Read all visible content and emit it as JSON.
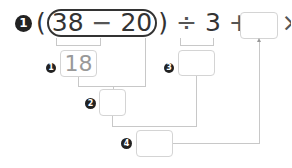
{
  "problem": {
    "number": "1",
    "open_paren": "(",
    "close_paren": ")",
    "a": "38",
    "minus": "−",
    "b": "20",
    "divide": "÷",
    "c": "3",
    "plus": "+",
    "d": "4",
    "times": "×",
    "e": "6",
    "equals": "="
  },
  "steps": [
    {
      "badge": "1",
      "value": "18"
    },
    {
      "badge": "2",
      "value": ""
    },
    {
      "badge": "3",
      "value": ""
    },
    {
      "badge": "4",
      "value": ""
    }
  ],
  "final_answer": ""
}
